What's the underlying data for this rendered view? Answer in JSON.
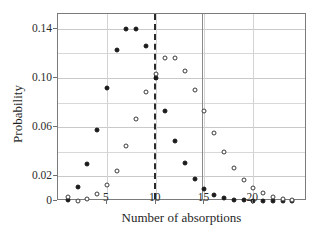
{
  "chart_data": {
    "type": "scatter",
    "title": "",
    "xlabel": "Number of absorptions",
    "ylabel": "Probability",
    "xlim": [
      0,
      25.5
    ],
    "ylim": [
      0,
      0.152
    ],
    "grid": true,
    "legend": "none",
    "xticks": [
      5,
      10,
      15,
      20
    ],
    "xtick_labels": [
      "5",
      "10",
      "15",
      "20"
    ],
    "yticks": [
      0,
      0.02,
      0.06,
      0.1,
      0.14
    ],
    "ytick_labels": [
      "0",
      "0.02",
      "0.06",
      "0.10",
      "0.14"
    ],
    "minor_gridlines_y": [
      0.04,
      0.08,
      0.12
    ],
    "x": [
      1,
      2,
      3,
      4,
      5,
      6,
      7,
      8,
      9,
      10,
      11,
      12,
      13,
      14,
      15,
      16,
      17,
      18,
      19,
      20,
      21,
      22,
      23,
      24
    ],
    "series": [
      {
        "name": "filled-circles",
        "marker": "filled-circle",
        "color": "#1b1b1b",
        "values": [
          0.0008,
          0.011,
          0.03,
          0.0575,
          0.092,
          0.1225,
          0.14,
          0.14,
          0.126,
          0.1,
          0.0735,
          0.049,
          0.0305,
          0.0175,
          0.0095,
          0.005,
          0.0022,
          0.001,
          0.0006,
          0.0004,
          0.0003,
          0.0002,
          0.0002,
          0.0001
        ]
      },
      {
        "name": "open-circles",
        "marker": "open-circle",
        "color": "#3a3a3a",
        "values": [
          0.003,
          0.0002,
          0.002,
          0.0055,
          0.0128,
          0.024,
          0.045,
          0.0665,
          0.0885,
          0.1035,
          0.116,
          0.116,
          0.1055,
          0.0905,
          0.073,
          0.055,
          0.04,
          0.0265,
          0.017,
          0.0108,
          0.0062,
          0.0035,
          0.0018,
          0.0008
        ]
      }
    ],
    "annotations": [
      {
        "name": "dashed-vertical-line",
        "type": "vline",
        "x": 9.85,
        "style": "dashed",
        "color": "#2a2a2a"
      },
      {
        "name": "solid-vertical-line",
        "type": "vline",
        "x": 14.75,
        "style": "solid",
        "color": "#8a8a8a"
      }
    ]
  }
}
